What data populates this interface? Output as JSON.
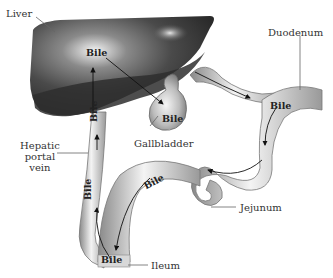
{
  "diagram": {
    "labels": {
      "liver": "Liver",
      "duodenum": "Duodenum",
      "gallbladder": "Gallbladder",
      "hepatic_portal_vein_line1": "Hepatic",
      "hepatic_portal_vein_line2": "portal",
      "hepatic_portal_vein_line3": "vein",
      "jejunum": "Jejunum",
      "ileum": "Ileum"
    },
    "bile_labels": {
      "liver": "Bile",
      "gallbladder": "Bile",
      "duodenum": "Bile",
      "portal_vein_upper": "Bile",
      "portal_vein_lower": "Bile",
      "intestine": "Bile",
      "ileum": "Bile"
    },
    "colors": {
      "liver": "#3a3a3a",
      "tube": "#b8b8b8",
      "tube_highlight": "#f2f2f2",
      "arrow": "#111111",
      "leader_line": "#666666"
    }
  }
}
